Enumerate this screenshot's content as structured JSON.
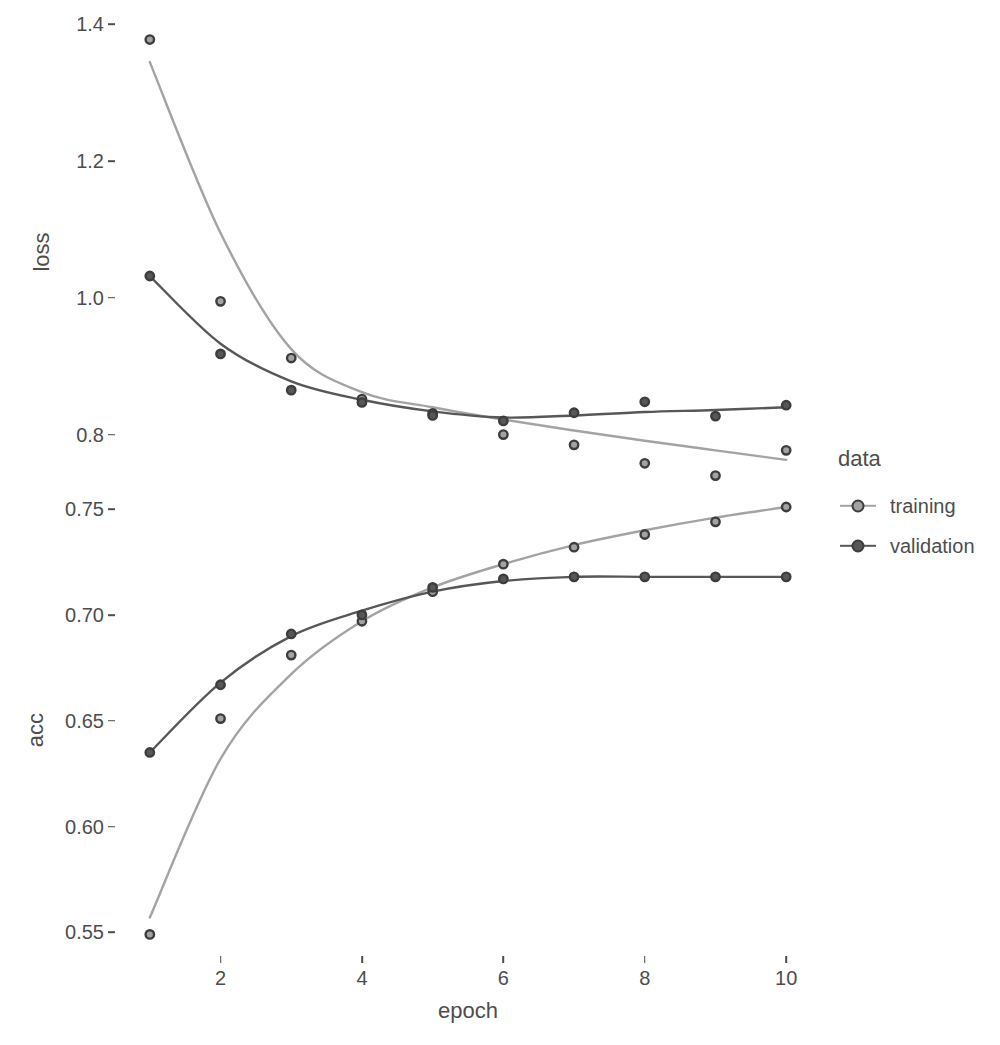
{
  "figure": {
    "background": "#ffffff",
    "axis_text_color": "#4d4d4d"
  },
  "axes": {
    "x_title": "epoch",
    "x_ticks": [
      "2",
      "4",
      "6",
      "8",
      "10"
    ],
    "panel_loss_title": "loss",
    "panel_loss_ticks": [
      "1.4",
      "1.2",
      "1.0",
      "0.8"
    ],
    "panel_acc_title": "acc",
    "panel_acc_ticks": [
      "0.75",
      "0.70",
      "0.65",
      "0.60",
      "0.55"
    ]
  },
  "legend": {
    "title": "data",
    "items": [
      {
        "label": "training",
        "color": "#a3a3a3"
      },
      {
        "label": "validation",
        "color": "#575757"
      }
    ]
  },
  "chart_data": [
    {
      "type": "line",
      "title": "loss",
      "xlabel": "epoch",
      "ylabel": "loss",
      "xlim": [
        0.55,
        10.45
      ],
      "ylim": [
        0.7365,
        1.4095
      ],
      "xticks": [
        2,
        4,
        6,
        8,
        10
      ],
      "yticks": [
        1.4,
        1.2,
        1.0,
        0.8
      ],
      "grid": false,
      "legend_position": "right",
      "x": [
        1,
        2,
        3,
        4,
        5,
        6,
        7,
        8,
        9,
        10
      ],
      "series": [
        {
          "name": "training",
          "color": "#a3a3a3",
          "values": [
            1.378,
            0.995,
            0.912,
            0.852,
            0.831,
            0.8,
            0.785,
            0.758,
            0.74,
            0.777
          ],
          "smoothed": [
            1.345,
            1.095,
            0.925,
            0.862,
            0.84,
            0.822,
            0.806,
            0.791,
            0.777,
            0.763
          ]
        },
        {
          "name": "validation",
          "color": "#575757",
          "values": [
            1.032,
            0.918,
            0.865,
            0.847,
            0.828,
            0.82,
            0.832,
            0.848,
            0.827,
            0.843
          ],
          "smoothed": [
            1.032,
            0.933,
            0.878,
            0.851,
            0.834,
            0.825,
            0.828,
            0.833,
            0.836,
            0.84
          ]
        }
      ]
    },
    {
      "type": "line",
      "title": "acc",
      "xlabel": "epoch",
      "ylabel": "acc",
      "xlim": [
        0.55,
        10.45
      ],
      "ylim": [
        0.5388,
        0.7562
      ],
      "xticks": [
        2,
        4,
        6,
        8,
        10
      ],
      "yticks": [
        0.75,
        0.7,
        0.65,
        0.6,
        0.55
      ],
      "grid": false,
      "legend_position": "right",
      "x": [
        1,
        2,
        3,
        4,
        5,
        6,
        7,
        8,
        9,
        10
      ],
      "series": [
        {
          "name": "training",
          "color": "#a3a3a3",
          "values": [
            0.549,
            0.651,
            0.681,
            0.697,
            0.711,
            0.724,
            0.732,
            0.738,
            0.744,
            0.751
          ],
          "smoothed": [
            0.557,
            0.632,
            0.672,
            0.697,
            0.713,
            0.724,
            0.733,
            0.74,
            0.746,
            0.751
          ]
        },
        {
          "name": "validation",
          "color": "#575757",
          "values": [
            0.635,
            0.667,
            0.691,
            0.7,
            0.713,
            0.717,
            0.718,
            0.718,
            0.718,
            0.718
          ],
          "smoothed": [
            0.635,
            0.668,
            0.69,
            0.702,
            0.711,
            0.716,
            0.718,
            0.718,
            0.718,
            0.718
          ]
        }
      ]
    }
  ]
}
